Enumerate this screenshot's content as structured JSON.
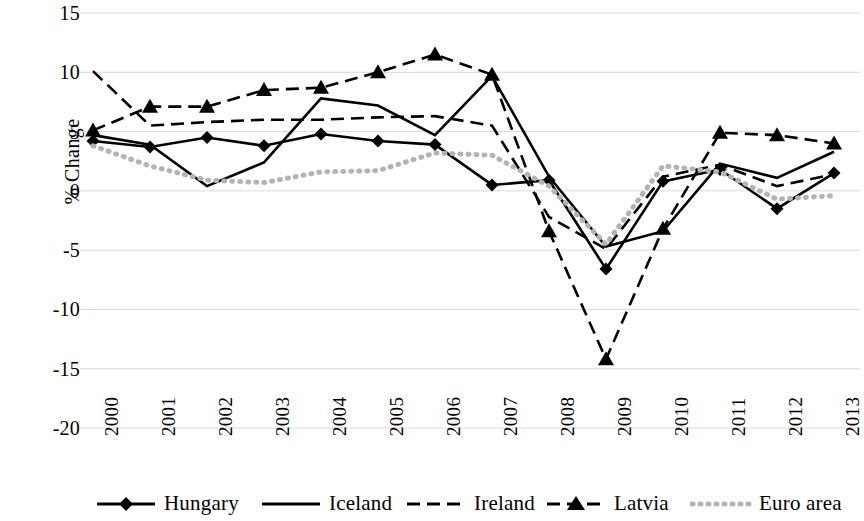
{
  "chart_data": {
    "type": "line",
    "title": "",
    "xlabel": "",
    "ylabel": "% Change",
    "categories": [
      "2000",
      "2001",
      "2002",
      "2003",
      "2004",
      "2005",
      "2006",
      "2007",
      "2008",
      "2009",
      "2010",
      "2011",
      "2012",
      "2013"
    ],
    "ylim": [
      -20,
      15
    ],
    "ytick_values": [
      15,
      10,
      5,
      0,
      -5,
      -10,
      -15,
      -20
    ],
    "ytick_labels": [
      "15",
      "10",
      "5",
      "0",
      "-5",
      "-10",
      "-15",
      "-20"
    ],
    "grid": "horizontal",
    "legend_position": "bottom",
    "series": [
      {
        "name": "Hungary",
        "style": "solid",
        "marker": "diamond",
        "color": "#000000",
        "values": [
          4.2,
          3.7,
          4.5,
          3.8,
          4.8,
          4.2,
          3.9,
          0.5,
          0.9,
          -6.6,
          0.8,
          1.8,
          -1.5,
          1.5
        ]
      },
      {
        "name": "Iceland",
        "style": "solid",
        "marker": "none",
        "color": "#000000",
        "values": [
          4.7,
          3.9,
          0.4,
          2.4,
          7.8,
          7.2,
          4.7,
          9.7,
          1.2,
          -4.7,
          -3.4,
          2.3,
          1.1,
          3.3
        ]
      },
      {
        "name": "Ireland",
        "style": "dashed",
        "marker": "none",
        "color": "#000000",
        "values": [
          10.1,
          5.5,
          5.8,
          6.0,
          6.0,
          6.2,
          6.3,
          5.5,
          -2.2,
          -4.9,
          1.2,
          2.2,
          0.4,
          1.4
        ]
      },
      {
        "name": "Latvia",
        "style": "dashed",
        "marker": "triangle",
        "color": "#000000",
        "values": [
          5.1,
          7.1,
          7.1,
          8.5,
          8.7,
          10.0,
          11.5,
          9.8,
          -3.4,
          -14.2,
          -3.2,
          4.9,
          4.7,
          4.0
        ]
      },
      {
        "name": "Euro area",
        "style": "dotted",
        "marker": "none",
        "color": "#b3b3b3",
        "values": [
          3.8,
          2.1,
          0.9,
          0.7,
          1.6,
          1.7,
          3.2,
          3.0,
          0.4,
          -4.5,
          2.1,
          1.6,
          -0.7,
          -0.4
        ]
      }
    ]
  },
  "axis": {
    "ylabel": "% Change"
  },
  "legend": {
    "items": [
      {
        "label": "Hungary"
      },
      {
        "label": "Iceland"
      },
      {
        "label": "Ireland"
      },
      {
        "label": "Latvia"
      },
      {
        "label": "Euro area"
      }
    ]
  }
}
